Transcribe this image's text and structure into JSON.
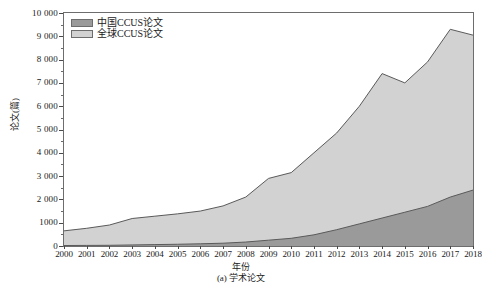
{
  "chart_data": {
    "type": "area",
    "title": "",
    "caption": "(a) 学术论文",
    "xlabel": "年份",
    "ylabel": "论文(篇)",
    "stacked": false,
    "grid": false,
    "legend_position": "top-left",
    "xlim": [
      2000,
      2018
    ],
    "ylim": [
      0,
      10000
    ],
    "ytick_step": 1000,
    "ytick_labels": [
      "0",
      "1000",
      "2 000",
      "3 000",
      "4 000",
      "5 000",
      "6 000",
      "7 000",
      "8 000",
      "9 000",
      "10 000"
    ],
    "ytick_values": [
      0,
      1000,
      2000,
      3000,
      4000,
      5000,
      6000,
      7000,
      8000,
      9000,
      10000
    ],
    "categories": [
      2000,
      2001,
      2002,
      2003,
      2004,
      2005,
      2006,
      2007,
      2008,
      2009,
      2010,
      2011,
      2012,
      2013,
      2014,
      2015,
      2016,
      2017,
      2018
    ],
    "xtick_labels": [
      "2000",
      "2001",
      "2002",
      "2003",
      "2004",
      "2005",
      "2006",
      "2007",
      "2008",
      "2009",
      "2010",
      "2011",
      "2012",
      "2013",
      "2014",
      "2015",
      "2016",
      "2017",
      "2018"
    ],
    "series": [
      {
        "name": "全球CCUS论文",
        "color": "#d2d2d2",
        "line_color": "#5a5a5a",
        "values": [
          650,
          760,
          900,
          1180,
          1280,
          1380,
          1500,
          1720,
          2100,
          2900,
          3150,
          4000,
          4850,
          6000,
          7400,
          7000,
          7900,
          9300,
          9050
        ]
      },
      {
        "name": "中国CCUS论文",
        "color": "#9a9a9a",
        "line_color": "#5a5a5a",
        "values": [
          20,
          25,
          30,
          45,
          60,
          75,
          95,
          120,
          170,
          250,
          330,
          480,
          700,
          950,
          1200,
          1450,
          1700,
          2100,
          2400
        ]
      }
    ]
  },
  "legend": {
    "items": [
      {
        "label": "中国CCUS论文",
        "color": "#9a9a9a"
      },
      {
        "label": "全球CCUS论文",
        "color": "#d2d2d2"
      }
    ]
  },
  "axes": {
    "y_title": "论文(篇)",
    "x_title": "年份"
  },
  "caption": {
    "text": "(a) 学术论文"
  }
}
